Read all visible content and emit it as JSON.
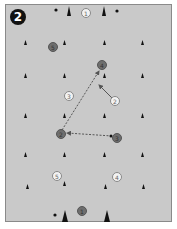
{
  "diagram": {
    "badge_number": "2",
    "colors": {
      "field": "#c9c9c9",
      "border": "#8a8a8a",
      "cone": "#1a1a1a",
      "dark_player": "#6e6e6e",
      "light_player": "#f2f2f2",
      "arrow": "#555555"
    },
    "dark_players": [
      {
        "label": "5",
        "x": 53,
        "y": 47
      },
      {
        "label": "4",
        "x": 102,
        "y": 65
      },
      {
        "label": "2",
        "x": 61,
        "y": 134
      },
      {
        "label": "3",
        "x": 117,
        "y": 138
      },
      {
        "label": "1",
        "x": 82,
        "y": 211
      }
    ],
    "light_players": [
      {
        "label": "1",
        "x": 86,
        "y": 13
      },
      {
        "label": "3",
        "x": 69,
        "y": 96
      },
      {
        "label": "2",
        "x": 115,
        "y": 101
      },
      {
        "label": "5",
        "x": 57,
        "y": 176
      },
      {
        "label": "4",
        "x": 117,
        "y": 177
      }
    ],
    "arrows": [
      {
        "from": "dark-2",
        "to": "dark-4",
        "style": "dashed"
      },
      {
        "from": "dark-3",
        "to": "dark-2",
        "style": "dashed"
      },
      {
        "from": "light-2",
        "to": "toward-dark-4",
        "style": "solid"
      }
    ]
  }
}
